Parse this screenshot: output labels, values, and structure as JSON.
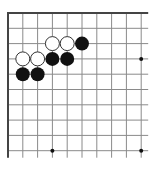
{
  "board": {
    "description": "Go board corner diagram (top-left), partial 10x10 view",
    "origin": {
      "x": 8,
      "y": 13
    },
    "spacing_x": 14.8,
    "spacing_y": 15.3,
    "cols": 10,
    "rows": 10,
    "line_extend_right": 7,
    "line_extend_bottom": 7,
    "colors": {
      "line": "#8a8a8a",
      "border": "#444444",
      "black": "#111111",
      "white": "#ffffff",
      "white_outline": "#333333",
      "star": "#111111"
    },
    "star_points": [
      {
        "col": 9,
        "row": 3
      },
      {
        "col": 3,
        "row": 9
      },
      {
        "col": 9,
        "row": 9
      }
    ],
    "stones": [
      {
        "color": "white",
        "col": 3,
        "row": 2
      },
      {
        "color": "white",
        "col": 4,
        "row": 2
      },
      {
        "color": "black",
        "col": 5,
        "row": 2
      },
      {
        "color": "white",
        "col": 1,
        "row": 3
      },
      {
        "color": "white",
        "col": 2,
        "row": 3
      },
      {
        "color": "black",
        "col": 3,
        "row": 3
      },
      {
        "color": "black",
        "col": 4,
        "row": 3
      },
      {
        "color": "black",
        "col": 1,
        "row": 4
      },
      {
        "color": "black",
        "col": 2,
        "row": 4
      }
    ]
  }
}
